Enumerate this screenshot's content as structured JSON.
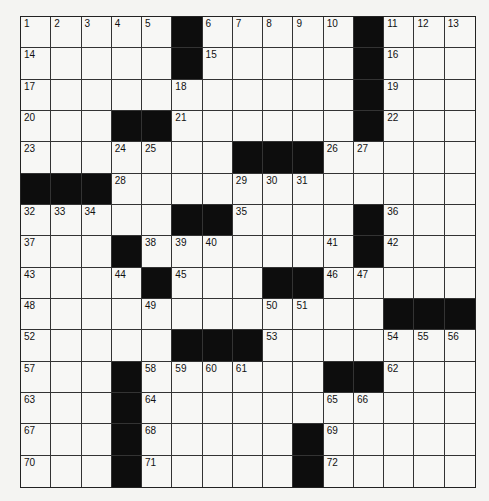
{
  "puzzle": {
    "rows": 15,
    "cols": 15,
    "colors": {
      "black": "#0d0d0d",
      "white": "#f7f7f5",
      "line": "#333333"
    },
    "grid": [
      [
        "1",
        "2",
        "3",
        "4",
        "5",
        "#",
        "6",
        "7",
        "8",
        "9",
        "10",
        "#",
        "11",
        "12",
        "13"
      ],
      [
        "14",
        ".",
        ".",
        ".",
        ".",
        "#",
        "15",
        ".",
        ".",
        ".",
        ".",
        "#",
        "16",
        ".",
        "."
      ],
      [
        "17",
        ".",
        ".",
        ".",
        ".",
        "18",
        ".",
        ".",
        ".",
        ".",
        ".",
        "#",
        "19",
        ".",
        "."
      ],
      [
        "20",
        ".",
        ".",
        "#",
        "#",
        "21",
        ".",
        ".",
        ".",
        ".",
        ".",
        "#",
        "22",
        ".",
        "."
      ],
      [
        "23",
        ".",
        ".",
        "24",
        "25",
        ".",
        ".",
        "#",
        "#",
        "#",
        "26",
        "27",
        ".",
        ".",
        "."
      ],
      [
        "#",
        "#",
        "#",
        "28",
        ".",
        ".",
        ".",
        "29",
        "30",
        "31",
        ".",
        ".",
        ".",
        ".",
        "."
      ],
      [
        "32",
        "33",
        "34",
        ".",
        ".",
        "#",
        "#",
        "35",
        ".",
        ".",
        ".",
        "#",
        "36",
        ".",
        "."
      ],
      [
        "37",
        ".",
        ".",
        "#",
        "38",
        "39",
        "40",
        ".",
        ".",
        ".",
        "41",
        "#",
        "42",
        ".",
        "."
      ],
      [
        "43",
        ".",
        ".",
        "44",
        "#",
        "45",
        ".",
        ".",
        "#",
        "#",
        "46",
        "47",
        ".",
        ".",
        "."
      ],
      [
        "48",
        ".",
        ".",
        ".",
        "49",
        ".",
        ".",
        ".",
        "50",
        "51",
        ".",
        ".",
        "#",
        "#",
        "#"
      ],
      [
        "52",
        ".",
        ".",
        ".",
        ".",
        "#",
        "#",
        "#",
        "53",
        ".",
        ".",
        ".",
        "54",
        "55",
        "56"
      ],
      [
        "57",
        ".",
        ".",
        "#",
        "58",
        "59",
        "60",
        "61",
        ".",
        ".",
        "#",
        "#",
        "62",
        ".",
        "."
      ],
      [
        "63",
        ".",
        ".",
        "#",
        "64",
        ".",
        ".",
        ".",
        ".",
        ".",
        "65",
        "66",
        ".",
        ".",
        "."
      ],
      [
        "67",
        ".",
        ".",
        "#",
        "68",
        ".",
        ".",
        ".",
        ".",
        "#",
        "69",
        ".",
        ".",
        ".",
        "."
      ],
      [
        "70",
        ".",
        ".",
        "#",
        "71",
        ".",
        ".",
        ".",
        ".",
        "#",
        "72",
        ".",
        ".",
        ".",
        "."
      ]
    ]
  }
}
